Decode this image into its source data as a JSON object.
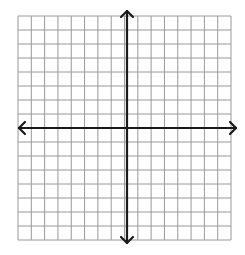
{
  "diagram": {
    "type": "coordinate-plane",
    "columns": 16,
    "rows": 16,
    "grid": {
      "left": 18,
      "top": 16,
      "right": 231,
      "bottom": 240
    },
    "origin": {
      "x": 127,
      "y": 128
    },
    "arrows": {
      "left": 19,
      "right": 236,
      "top": 11,
      "bottom": 243
    },
    "colors": {
      "grid": "#9a9a9a",
      "axis": "#1a1a1a",
      "background": "#ffffff"
    }
  }
}
